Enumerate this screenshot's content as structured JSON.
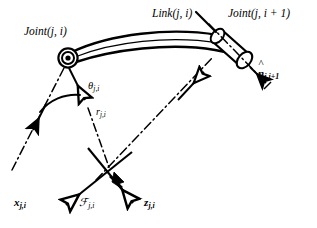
{
  "figure": {
    "kind": "kinematic-link-diagram",
    "background_color": "#ffffff",
    "ink_color": "#000000",
    "width": 317,
    "height": 228
  },
  "labels": {
    "joint_i": "Joint(j, i)",
    "link": "Link(j, i)",
    "joint_i_plus_1": "Joint(j, i + 1)",
    "normal_vector_base": "n",
    "normal_vector_sub": "j,i+1",
    "theta_base": "θ",
    "theta_sub": "j,i",
    "r_base": "r",
    "r_sub": "j,i",
    "x_axis_base": "x",
    "x_axis_sub": "j,i",
    "frame_base": "ℱ",
    "frame_sub": "j,i",
    "z_axis_base": "z",
    "z_axis_sub": "j,i"
  },
  "geometry": {
    "joint_i_center": [
      68,
      58
    ],
    "joint_i_outer_radius": 9,
    "joint_i_mid_radius": 6,
    "joint_i_inner_radius": 3,
    "joint_i1_center": [
      238,
      52
    ],
    "link_start": [
      74,
      55
    ],
    "link_end": [
      232,
      58
    ],
    "link_curve_apex": [
      155,
      38
    ],
    "frame_origin": [
      110,
      172
    ],
    "x_axis_tip": [
      62,
      208
    ],
    "z_axis_tip": [
      136,
      207
    ],
    "r_vector_tip": [
      86,
      103
    ],
    "theta_arc_radius": 38
  },
  "elements": {
    "pivot_joint": "concentric-circle-pivot",
    "distal_joint": "cylinder-sleeve",
    "link_body": "tapered-curved-beam",
    "axis_line_style": "dash-dot",
    "solid_arrow_style": "filled-double-barb",
    "open_arrow_style": "hollow-triangle"
  }
}
